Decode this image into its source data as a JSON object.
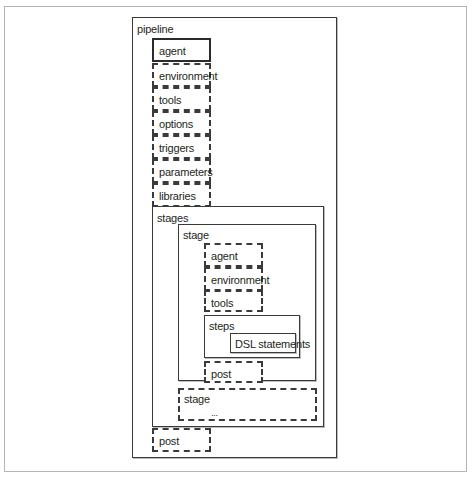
{
  "diagram": {
    "pipeline": {
      "label": "pipeline",
      "directives": [
        {
          "label": "agent",
          "required": true
        },
        {
          "label": "environment",
          "required": false
        },
        {
          "label": "tools",
          "required": false
        },
        {
          "label": "options",
          "required": false
        },
        {
          "label": "triggers",
          "required": false
        },
        {
          "label": "parameters",
          "required": false
        },
        {
          "label": "libraries",
          "required": false
        }
      ],
      "stages": {
        "label": "stages",
        "stage": {
          "label": "stage",
          "directives": [
            {
              "label": "agent",
              "required": false
            },
            {
              "label": "environment",
              "required": false
            },
            {
              "label": "tools",
              "required": false
            }
          ],
          "steps": {
            "label": "steps",
            "content": "DSL statements"
          },
          "post": {
            "label": "post",
            "required": false
          }
        },
        "additional_stage": {
          "label": "stage",
          "ellipsis": "..."
        }
      },
      "post": {
        "label": "post",
        "required": false
      }
    }
  },
  "legend": {
    "solid_border": "required",
    "dashed_border": "optional"
  }
}
